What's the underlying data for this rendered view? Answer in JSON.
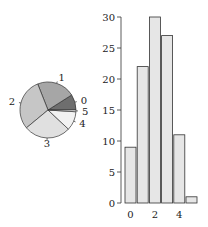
{
  "chart_data": [
    {
      "type": "pie",
      "title": "",
      "categories": [
        "0",
        "1",
        "2",
        "3",
        "4",
        "5"
      ],
      "values": [
        9,
        22,
        30,
        27,
        11,
        1
      ],
      "colors": [
        "#6e6e6e",
        "#a6a6a6",
        "#c6c6c6",
        "#e0e0e0",
        "#f2f2f2",
        "#ffffff"
      ],
      "start_angle_deg": 0,
      "direction": "counterclockwise"
    },
    {
      "type": "bar",
      "title": "",
      "xlabel": "",
      "ylabel": "",
      "categories": [
        "0",
        "1",
        "2",
        "3",
        "4",
        "5"
      ],
      "values": [
        9,
        22,
        30,
        27,
        11,
        1
      ],
      "ylim": [
        0,
        30
      ],
      "yticks": [
        "0",
        "5",
        "10",
        "15",
        "20",
        "25",
        "30"
      ],
      "xticks": [
        "0",
        "2",
        "4"
      ],
      "bar_color": "#e6e6e6",
      "grid": false
    }
  ]
}
